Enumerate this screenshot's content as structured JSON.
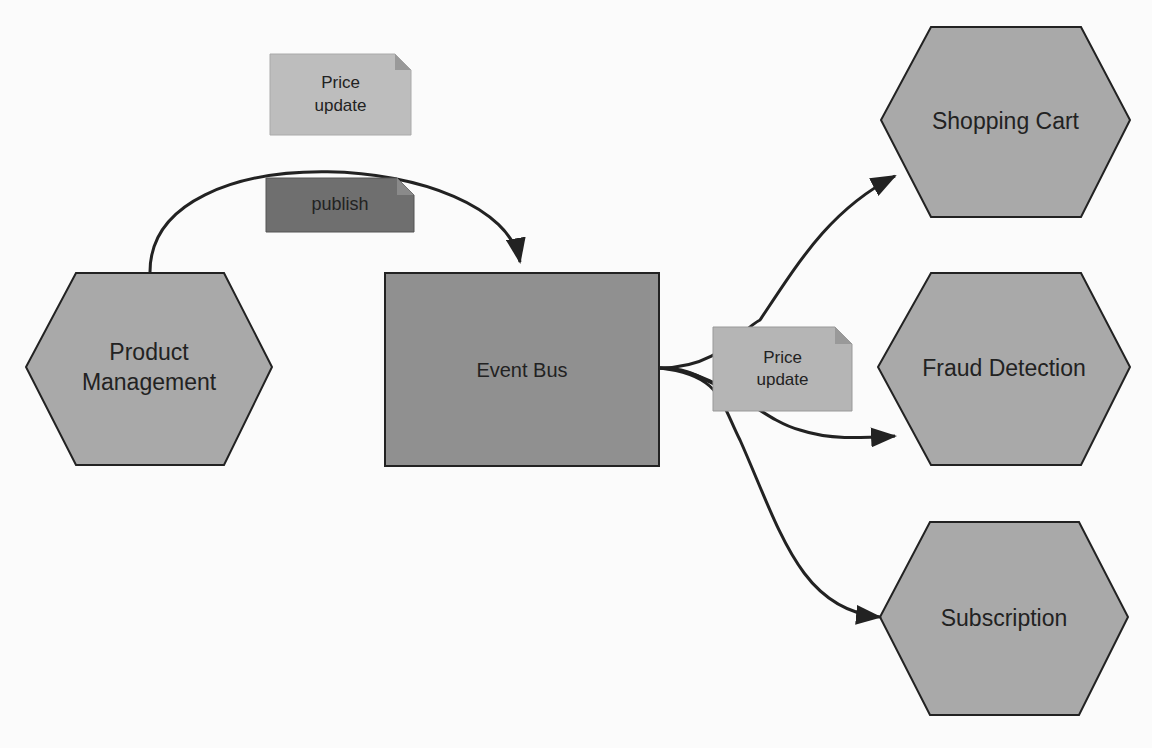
{
  "nodes": {
    "product_management": {
      "line1": "Product",
      "line2": "Management"
    },
    "event_bus": {
      "label": "Event Bus"
    },
    "shopping_cart": {
      "label": "Shopping Cart"
    },
    "fraud_detection": {
      "label": "Fraud Detection"
    },
    "subscription": {
      "label": "Subscription"
    }
  },
  "notes": {
    "price_update_top": {
      "line1": "Price",
      "line2": "update"
    },
    "publish": {
      "label": "publish"
    },
    "price_update_right": {
      "line1": "Price",
      "line2": "update"
    }
  },
  "colors": {
    "hexagon": "#a9a9a9",
    "event_bus": "#909090",
    "note_light": "#bdbdbd",
    "note_dark": "#6f6f6f",
    "stroke": "#222222"
  }
}
